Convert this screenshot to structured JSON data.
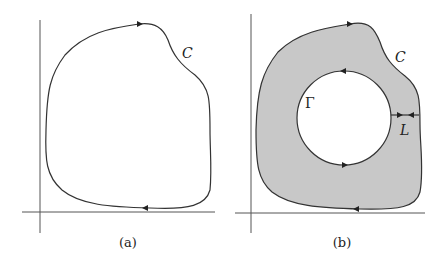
{
  "panels": [
    {
      "id": "a",
      "caption": "(a)",
      "curve_label": "C"
    },
    {
      "id": "b",
      "caption": "(b)",
      "curve_label": "C",
      "inner_curve_label": "Γ",
      "cut_label": "L"
    }
  ],
  "colors": {
    "stroke": "#333333",
    "fill_region": "#c8c8c8",
    "background": "#ffffff"
  }
}
